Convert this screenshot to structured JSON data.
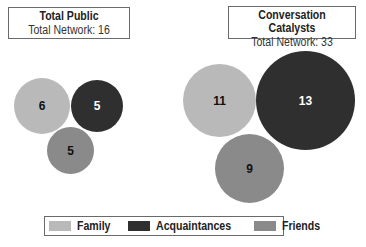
{
  "colors": {
    "family": "#b9b9b9",
    "acquaintances": "#2f2f2f",
    "friends": "#8a8a8a"
  },
  "panels": [
    {
      "title": "Total Public",
      "subtitle": "Total Network: 16",
      "circles": [
        {
          "category": "Family",
          "value": "6"
        },
        {
          "category": "Acquaintances",
          "value": "5"
        },
        {
          "category": "Friends",
          "value": "5"
        }
      ]
    },
    {
      "title": "Conversation Catalysts",
      "subtitle": "Total Network: 33",
      "circles": [
        {
          "category": "Family",
          "value": "11"
        },
        {
          "category": "Acquaintances",
          "value": "13"
        },
        {
          "category": "Friends",
          "value": "9"
        }
      ]
    }
  ],
  "legend": [
    {
      "label": "Family"
    },
    {
      "label": "Acquaintances"
    },
    {
      "label": "Friends"
    }
  ]
}
